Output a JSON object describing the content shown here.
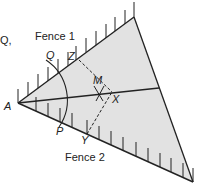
{
  "diagram": {
    "labels": {
      "stray": "Q,",
      "fence1": "Fence 1",
      "fence2": "Fence 2",
      "A": "A",
      "Q": "Q",
      "Z": "Z",
      "M": "M",
      "X": "X",
      "P": "P",
      "Y": "Y"
    },
    "colors": {
      "fill": "#e2e2e2",
      "line": "#222222"
    }
  }
}
